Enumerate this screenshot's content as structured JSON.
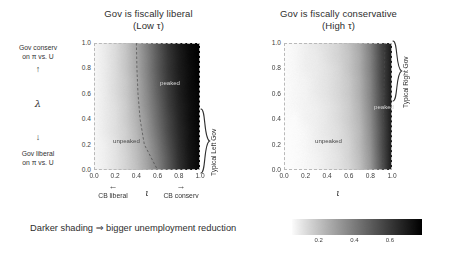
{
  "figure": {
    "caption": "Darker shading ⇒ bigger unemployment reduction",
    "y_axis_symbol": "λ",
    "x_axis_symbol": "ι",
    "up_arrow": "↑",
    "down_arrow": "↓",
    "left_arrow": "←",
    "right_arrow": "→"
  },
  "y_axis": {
    "top_label_line1": "Gov conserv",
    "top_label_line2": "on π vs. U",
    "bottom_label_line1": "Gov liberal",
    "bottom_label_line2": "on π vs. U",
    "ticks": [
      "1.0",
      "0.8",
      "0.6",
      "0.4",
      "0.2",
      "0.0"
    ],
    "tick_values": [
      1.0,
      0.8,
      0.6,
      0.4,
      0.2,
      0.0
    ]
  },
  "x_axis": {
    "ticks": [
      "0.0",
      "0.2",
      "0.4",
      "0.6",
      "0.8",
      "1.0"
    ],
    "tick_values": [
      0.0,
      0.2,
      0.4,
      0.6,
      0.8,
      1.0
    ],
    "left_label": "CB liberal",
    "right_label": "CB conserv"
  },
  "panels": [
    {
      "title_line1": "Gov is fiscally liberal",
      "title_line2": "(Low τ)",
      "region_low": "unpeaked",
      "region_high": "peaked",
      "bracket_label": "Typical Left Gov",
      "bracket_lambda_range": [
        0.02,
        0.52
      ],
      "boundary_curve": [
        {
          "lambda": 1.0,
          "iota": 0.4
        },
        {
          "lambda": 0.8,
          "iota": 0.405
        },
        {
          "lambda": 0.6,
          "iota": 0.415
        },
        {
          "lambda": 0.4,
          "iota": 0.435
        },
        {
          "lambda": 0.2,
          "iota": 0.475
        },
        {
          "lambda": 0.0,
          "iota": 0.6
        }
      ],
      "shading": {
        "min_value": 0.05,
        "max_value": 0.75,
        "dark_edge": "right",
        "ramp_center": 0.62,
        "ramp_width": 0.4
      }
    },
    {
      "title_line1": "Gov is fiscally conservative",
      "title_line2": "(High τ)",
      "region_low": "unpeaked",
      "region_high": "peaked",
      "bracket_label": "Typical Right Gov",
      "bracket_lambda_range": [
        0.52,
        1.0
      ],
      "boundary_curve": [
        {
          "lambda": 1.0,
          "iota": 0.935
        },
        {
          "lambda": 0.8,
          "iota": 0.93
        },
        {
          "lambda": 0.6,
          "iota": 0.925
        },
        {
          "lambda": 0.4,
          "iota": 0.92
        },
        {
          "lambda": 0.2,
          "iota": 0.915
        },
        {
          "lambda": 0.0,
          "iota": 0.91
        }
      ],
      "shading": {
        "min_value": 0.03,
        "max_value": 0.7,
        "dark_edge": "right",
        "ramp_center": 0.93,
        "ramp_width": 0.22
      }
    }
  ],
  "colorbar": {
    "ticks": [
      "0.2",
      "0.4",
      "0.6"
    ],
    "tick_values": [
      0.2,
      0.4,
      0.6
    ],
    "range": [
      0.05,
      0.78
    ],
    "orientation": "horizontal",
    "colormap": "grayscale-reversed"
  },
  "chart_data": {
    "type": "heatmap",
    "xlabel": "ι",
    "ylabel": "λ",
    "xlim": [
      0.0,
      1.0
    ],
    "ylim": [
      0.0,
      1.0
    ],
    "grid": false,
    "legend": "colorbar-bottom",
    "colorbar_label": "Darker shading ⇒ bigger unemployment reduction",
    "colorbar_ticks": [
      0.2,
      0.4,
      0.6
    ],
    "annotations": [
      "unpeaked",
      "peaked",
      "Typical Left Gov",
      "Typical Right Gov"
    ],
    "panels": [
      {
        "name": "Gov is fiscally liberal (Low τ)",
        "x": [
          0.0,
          0.1,
          0.2,
          0.3,
          0.4,
          0.5,
          0.6,
          0.7,
          0.8,
          0.9,
          1.0
        ],
        "y": [
          0.0,
          0.1,
          0.2,
          0.3,
          0.4,
          0.5,
          0.6,
          0.7,
          0.8,
          0.9,
          1.0
        ],
        "z_rows_bottom_to_top": [
          [
            0.06,
            0.08,
            0.11,
            0.15,
            0.2,
            0.28,
            0.38,
            0.5,
            0.62,
            0.71,
            0.76
          ],
          [
            0.06,
            0.08,
            0.11,
            0.15,
            0.21,
            0.29,
            0.39,
            0.51,
            0.63,
            0.71,
            0.76
          ],
          [
            0.06,
            0.08,
            0.11,
            0.16,
            0.22,
            0.3,
            0.41,
            0.53,
            0.64,
            0.72,
            0.76
          ],
          [
            0.06,
            0.09,
            0.12,
            0.16,
            0.23,
            0.32,
            0.43,
            0.55,
            0.65,
            0.72,
            0.77
          ],
          [
            0.06,
            0.09,
            0.12,
            0.17,
            0.24,
            0.33,
            0.45,
            0.56,
            0.66,
            0.73,
            0.77
          ],
          [
            0.06,
            0.09,
            0.12,
            0.17,
            0.25,
            0.35,
            0.46,
            0.58,
            0.67,
            0.73,
            0.77
          ],
          [
            0.06,
            0.09,
            0.13,
            0.18,
            0.26,
            0.36,
            0.48,
            0.59,
            0.68,
            0.74,
            0.77
          ],
          [
            0.06,
            0.09,
            0.13,
            0.18,
            0.26,
            0.37,
            0.49,
            0.6,
            0.68,
            0.74,
            0.78
          ],
          [
            0.06,
            0.09,
            0.13,
            0.19,
            0.27,
            0.38,
            0.5,
            0.61,
            0.69,
            0.74,
            0.78
          ],
          [
            0.06,
            0.09,
            0.13,
            0.19,
            0.27,
            0.38,
            0.5,
            0.61,
            0.69,
            0.75,
            0.78
          ],
          [
            0.06,
            0.09,
            0.13,
            0.19,
            0.28,
            0.39,
            0.51,
            0.62,
            0.7,
            0.75,
            0.78
          ]
        ]
      },
      {
        "name": "Gov is fiscally conservative (High τ)",
        "x": [
          0.0,
          0.1,
          0.2,
          0.3,
          0.4,
          0.5,
          0.6,
          0.7,
          0.8,
          0.9,
          1.0
        ],
        "y": [
          0.0,
          0.1,
          0.2,
          0.3,
          0.4,
          0.5,
          0.6,
          0.7,
          0.8,
          0.9,
          1.0
        ],
        "z_rows_bottom_to_top": [
          [
            0.04,
            0.05,
            0.06,
            0.07,
            0.09,
            0.11,
            0.14,
            0.2,
            0.31,
            0.5,
            0.7
          ],
          [
            0.04,
            0.05,
            0.06,
            0.07,
            0.09,
            0.11,
            0.15,
            0.21,
            0.32,
            0.51,
            0.7
          ],
          [
            0.04,
            0.05,
            0.06,
            0.08,
            0.09,
            0.12,
            0.15,
            0.22,
            0.33,
            0.52,
            0.7
          ],
          [
            0.04,
            0.05,
            0.06,
            0.08,
            0.1,
            0.12,
            0.16,
            0.22,
            0.34,
            0.52,
            0.7
          ],
          [
            0.05,
            0.05,
            0.07,
            0.08,
            0.1,
            0.13,
            0.17,
            0.23,
            0.35,
            0.53,
            0.7
          ],
          [
            0.05,
            0.06,
            0.07,
            0.08,
            0.1,
            0.13,
            0.17,
            0.24,
            0.36,
            0.54,
            0.7
          ],
          [
            0.05,
            0.06,
            0.07,
            0.09,
            0.11,
            0.14,
            0.18,
            0.25,
            0.37,
            0.54,
            0.7
          ],
          [
            0.05,
            0.06,
            0.07,
            0.09,
            0.11,
            0.14,
            0.18,
            0.25,
            0.37,
            0.55,
            0.7
          ],
          [
            0.05,
            0.06,
            0.08,
            0.09,
            0.11,
            0.14,
            0.19,
            0.26,
            0.38,
            0.55,
            0.7
          ],
          [
            0.05,
            0.06,
            0.08,
            0.09,
            0.12,
            0.15,
            0.19,
            0.26,
            0.38,
            0.55,
            0.7
          ],
          [
            0.05,
            0.06,
            0.08,
            0.1,
            0.12,
            0.15,
            0.2,
            0.27,
            0.39,
            0.56,
            0.7
          ]
        ]
      }
    ]
  }
}
